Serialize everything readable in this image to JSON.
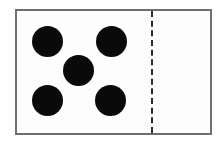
{
  "image": {
    "subject": "domino-tile",
    "alt_text": "Domino tile showing five pips on the left half and two pips on the right half",
    "width": 223,
    "height": 145,
    "background_color": "#ffffff"
  },
  "tile": {
    "face_color": "#fdfdfd",
    "border_color": "#6f6f6f",
    "border_width": 2,
    "pip_color": "#0a0a0a",
    "pip_diameter": 31
  },
  "divider": {
    "label": "center divider",
    "style": "dashed",
    "color": "#2b2b2b",
    "width": 2
  },
  "halves": [
    {
      "id": "left",
      "label": "left half",
      "pip_count": "5",
      "pip_layout": "quincunx",
      "pips": [
        {
          "position": "top-left"
        },
        {
          "position": "top-right"
        },
        {
          "position": "center"
        },
        {
          "position": "bottom-left"
        },
        {
          "position": "bottom-right"
        }
      ]
    },
    {
      "id": "right",
      "label": "right half",
      "pip_count": "2",
      "pip_layout": "vertical-pair",
      "pips": [
        {
          "position": "top"
        },
        {
          "position": "bottom"
        }
      ]
    }
  ],
  "summary": {
    "notation": "5-2",
    "total_pips": "7"
  }
}
